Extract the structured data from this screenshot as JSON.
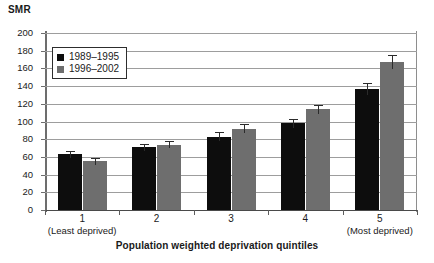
{
  "chart_data": {
    "type": "bar",
    "title": "",
    "ylabel": "SMR",
    "xlabel": "Population weighted deprivation quintiles",
    "categories": [
      "1",
      "2",
      "3",
      "4",
      "5"
    ],
    "category_end_labels": {
      "first": "(Least deprived)",
      "last": "(Most deprived)"
    },
    "ylim": [
      0,
      200
    ],
    "ytick_step": 20,
    "yticks": [
      "200",
      "180",
      "160",
      "140",
      "120",
      "100",
      "80",
      "60",
      "40",
      "20",
      "0"
    ],
    "grid": true,
    "legend_position": "top-left",
    "series": [
      {
        "name": "1989–1995",
        "color": "#0d0d0d",
        "values": [
          63,
          71,
          83,
          98,
          137
        ],
        "error_low": [
          59,
          67,
          78,
          93,
          130
        ],
        "error_high": [
          67,
          75,
          88,
          103,
          144
        ]
      },
      {
        "name": "1996–2002",
        "color": "#6e6e6e",
        "values": [
          55,
          74,
          92,
          114,
          167
        ],
        "error_low": [
          51,
          70,
          87,
          109,
          159
        ],
        "error_high": [
          59,
          78,
          97,
          119,
          175
        ]
      }
    ]
  }
}
